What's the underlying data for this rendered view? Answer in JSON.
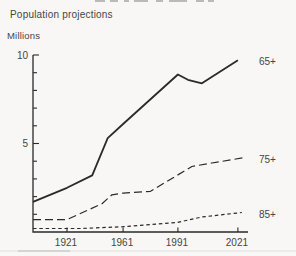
{
  "page": {
    "title": "Population projections",
    "y_axis_unit_label": "Millions"
  },
  "colors": {
    "ink": "#2a2a2a",
    "text": "#454545",
    "background": "#f8f7f5"
  },
  "chart_data": {
    "type": "line",
    "title": "Population projections",
    "ylabel": "Millions",
    "ylim": [
      0,
      10
    ],
    "y_major_ticks": [
      5,
      10
    ],
    "y_minor_tick_step": 1,
    "grid": false,
    "legend_position": "right-of-line-ends",
    "x_tick_labels": [
      "1921",
      "1961",
      "1991",
      "2021"
    ],
    "x_axis_calibration": {
      "years": [
        1901,
        1921,
        1961,
        1991,
        2021
      ],
      "fracs": [
        0,
        0.158,
        0.419,
        0.674,
        0.953
      ]
    },
    "series": [
      {
        "name": "65+",
        "style": "solid",
        "points": [
          [
            1901,
            1.7
          ],
          [
            1921,
            2.5
          ],
          [
            1939,
            3.2
          ],
          [
            1950,
            5.3
          ],
          [
            1961,
            6.1
          ],
          [
            1991,
            8.9
          ],
          [
            1996,
            8.6
          ],
          [
            2003,
            8.4
          ],
          [
            2021,
            9.7
          ]
        ]
      },
      {
        "name": "75+",
        "style": "long-dash",
        "points": [
          [
            1901,
            0.7
          ],
          [
            1921,
            0.7
          ],
          [
            1946,
            1.6
          ],
          [
            1953,
            2.1
          ],
          [
            1961,
            2.2
          ],
          [
            1976,
            2.3
          ],
          [
            1998,
            3.7
          ],
          [
            2008,
            3.9
          ],
          [
            2024,
            4.2
          ]
        ]
      },
      {
        "name": "85+",
        "style": "short-dash",
        "points": [
          [
            1901,
            0.2
          ],
          [
            1931,
            0.2
          ],
          [
            1961,
            0.3
          ],
          [
            1991,
            0.55
          ],
          [
            2003,
            0.85
          ],
          [
            2023,
            1.1
          ]
        ]
      }
    ]
  }
}
